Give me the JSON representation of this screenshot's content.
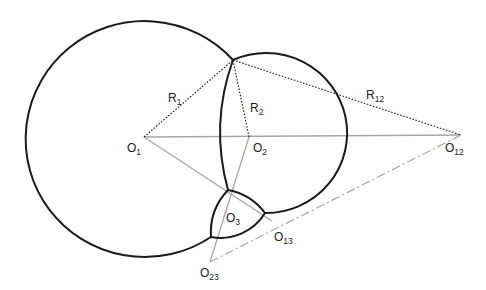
{
  "diagram": {
    "type": "geometric construction of three intersecting circular arcs (bubble cluster)",
    "colors": {
      "arc": "#1a1a1a",
      "dotted_radius": "#1a1a1a",
      "center_line": "#a0a0a0",
      "dashdot_line": "#a0a0a0",
      "label": "#222222"
    },
    "points": {
      "O1": {
        "x": 144,
        "y": 137
      },
      "O2": {
        "x": 249,
        "y": 137
      },
      "O12": {
        "x": 461,
        "y": 135
      },
      "O13": {
        "x": 272,
        "y": 221
      },
      "O23": {
        "x": 210,
        "y": 262
      },
      "P_top": {
        "x": 233,
        "y": 60
      },
      "P_a": {
        "x": 228,
        "y": 190
      },
      "P_b": {
        "x": 265,
        "y": 213
      },
      "P_c": {
        "x": 211,
        "y": 237
      }
    },
    "labels": {
      "R1": {
        "main": "R",
        "sub": "1"
      },
      "R2": {
        "main": "R",
        "sub": "2"
      },
      "R12": {
        "main": "R",
        "sub": "12"
      },
      "O1": {
        "main": "O",
        "sub": "1"
      },
      "O2": {
        "main": "O",
        "sub": "2"
      },
      "O3": {
        "main": "O",
        "sub": "3"
      },
      "O12": {
        "main": "O",
        "sub": "12"
      },
      "O13": {
        "main": "O",
        "sub": "13"
      },
      "O23": {
        "main": "O",
        "sub": "23"
      }
    }
  }
}
